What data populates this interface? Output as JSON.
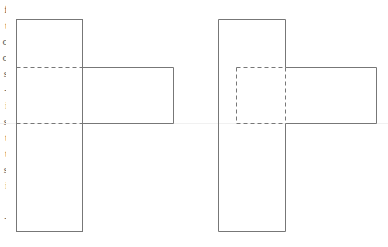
{
  "clipped_text_column": {
    "glyphs": [
      "f",
      "t",
      "o",
      "o",
      "s",
      "-",
      "i",
      "s",
      "t",
      "t",
      "s",
      "i",
      "'",
      "-",
      ""
    ]
  },
  "colors": {
    "stroke": "#777777",
    "background": "#ffffff"
  },
  "figures": [
    {
      "name": "left-net",
      "column": {
        "x": 16,
        "y": 19,
        "w": 66,
        "h": 212
      },
      "fold_lines_y": [
        67,
        123
      ],
      "side_flap": {
        "x": 82,
        "y": 67,
        "w": 91,
        "h": 56
      }
    },
    {
      "name": "right-net",
      "column": {
        "x": 218,
        "y": 19,
        "w": 67,
        "h": 212
      },
      "hidden_square": {
        "x": 236,
        "y": 67,
        "w": 49,
        "h": 56
      },
      "side_flap": {
        "x": 285,
        "y": 67,
        "w": 91,
        "h": 56
      }
    }
  ]
}
